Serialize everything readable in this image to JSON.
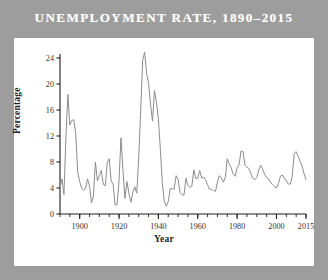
{
  "title": "UNEMPLOYMENT RATE, 1890–2015",
  "colors": {
    "background": "#9d9d9d",
    "panel": "#ffffff",
    "title_text": "#ffffff",
    "line": "#8c8c8c",
    "axis": "#1d1d1d",
    "tick_text": "#333333"
  },
  "chart_data": {
    "type": "line",
    "title": "UNEMPLOYMENT RATE, 1890–2015",
    "xlabel": "Year",
    "ylabel": "Percentage",
    "xlim": [
      1890,
      2015
    ],
    "ylim": [
      0,
      24
    ],
    "grid": false,
    "legend": null,
    "xticks": [
      1900,
      1920,
      1940,
      1960,
      1980,
      2000,
      2015
    ],
    "xticklabels": [
      "1900",
      "1920",
      "1940",
      "1960",
      "1980",
      "2000",
      "2015"
    ],
    "xminor_step": 5,
    "yticks": [
      0,
      4,
      8,
      12,
      16,
      20,
      24
    ],
    "yticklabels": [
      "0",
      "4",
      "8",
      "12",
      "16",
      "20",
      "24"
    ],
    "series": [
      {
        "name": "Unemployment rate",
        "color": "#8c8c8c",
        "x": [
          1890,
          1891,
          1892,
          1893,
          1894,
          1895,
          1896,
          1897,
          1898,
          1899,
          1900,
          1901,
          1902,
          1903,
          1904,
          1905,
          1906,
          1907,
          1908,
          1909,
          1910,
          1911,
          1912,
          1913,
          1914,
          1915,
          1916,
          1917,
          1918,
          1919,
          1920,
          1921,
          1922,
          1923,
          1924,
          1925,
          1926,
          1927,
          1928,
          1929,
          1930,
          1931,
          1932,
          1933,
          1934,
          1935,
          1936,
          1937,
          1938,
          1939,
          1940,
          1941,
          1942,
          1943,
          1944,
          1945,
          1946,
          1947,
          1948,
          1949,
          1950,
          1951,
          1952,
          1953,
          1954,
          1955,
          1956,
          1957,
          1958,
          1959,
          1960,
          1961,
          1962,
          1963,
          1964,
          1965,
          1966,
          1967,
          1968,
          1969,
          1970,
          1971,
          1972,
          1973,
          1974,
          1975,
          1976,
          1977,
          1978,
          1979,
          1980,
          1981,
          1982,
          1983,
          1984,
          1985,
          1986,
          1987,
          1988,
          1989,
          1990,
          1991,
          1992,
          1993,
          1994,
          1995,
          1996,
          1997,
          1998,
          1999,
          2000,
          2001,
          2002,
          2003,
          2004,
          2005,
          2006,
          2007,
          2008,
          2009,
          2010,
          2011,
          2012,
          2013,
          2014,
          2015
        ],
        "values": [
          4.0,
          5.4,
          3.0,
          11.7,
          18.4,
          13.7,
          14.4,
          14.5,
          12.4,
          6.5,
          5.0,
          4.0,
          3.7,
          3.9,
          5.4,
          4.3,
          1.7,
          2.8,
          8.0,
          5.1,
          5.9,
          6.7,
          4.6,
          4.3,
          7.9,
          8.5,
          5.1,
          4.6,
          1.4,
          1.4,
          5.2,
          11.7,
          6.7,
          2.4,
          5.0,
          3.2,
          1.8,
          3.3,
          4.2,
          3.2,
          8.7,
          15.9,
          23.6,
          24.9,
          21.7,
          20.1,
          16.9,
          14.3,
          19.0,
          17.2,
          14.6,
          9.9,
          4.7,
          1.9,
          1.2,
          1.9,
          3.9,
          3.9,
          3.8,
          5.9,
          5.3,
          3.3,
          3.0,
          2.9,
          5.5,
          4.4,
          4.1,
          4.3,
          6.8,
          5.5,
          5.5,
          6.7,
          5.5,
          5.7,
          5.2,
          4.5,
          3.8,
          3.8,
          3.6,
          3.5,
          4.9,
          5.9,
          5.6,
          4.9,
          5.6,
          8.5,
          7.7,
          7.1,
          6.1,
          5.8,
          7.1,
          7.6,
          9.7,
          9.6,
          7.5,
          7.2,
          7.0,
          6.2,
          5.5,
          5.3,
          5.6,
          6.8,
          7.5,
          6.9,
          6.1,
          5.6,
          5.4,
          4.9,
          4.5,
          4.2,
          4.0,
          4.7,
          5.8,
          6.0,
          5.5,
          5.1,
          4.6,
          4.6,
          5.8,
          9.3,
          9.6,
          8.9,
          8.1,
          7.4,
          6.2,
          5.3
        ]
      }
    ]
  }
}
